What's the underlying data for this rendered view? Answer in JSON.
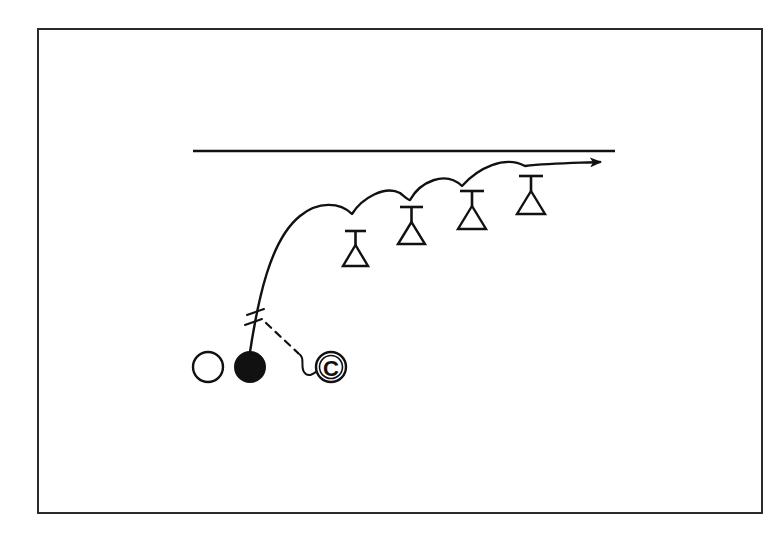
{
  "diagram": {
    "type": "sports drill diagram",
    "colors": {
      "ink": "#111111",
      "background": "#ffffff",
      "frame": "#2a2a2a"
    },
    "frame": {
      "x": 38,
      "y": 29,
      "width": 724,
      "height": 484
    },
    "boundary_line": {
      "x1": 193,
      "y1": 151,
      "x2": 615,
      "y2": 151
    },
    "players": [
      {
        "id": "open-player",
        "shape": "open-circle",
        "cx": 208,
        "cy": 367,
        "r": 15
      },
      {
        "id": "ball-carrier",
        "shape": "filled-circle",
        "cx": 250,
        "cy": 367,
        "r": 15
      },
      {
        "id": "coach",
        "shape": "circled-letter",
        "cx": 331,
        "cy": 367,
        "r": 15,
        "label": "C"
      }
    ],
    "cones": [
      {
        "id": "cone-1",
        "x": 355,
        "top": 231,
        "bottom": 267
      },
      {
        "id": "cone-2",
        "x": 411,
        "top": 207,
        "bottom": 243
      },
      {
        "id": "cone-3",
        "x": 472,
        "top": 190,
        "bottom": 229
      },
      {
        "id": "cone-4",
        "x": 531,
        "top": 176,
        "bottom": 214
      }
    ],
    "route": {
      "description": "Run path from ball carrier weaving over four cones, ending in arrow toward right",
      "end_arrow": {
        "x": 600,
        "y": 162
      }
    },
    "pass_line": {
      "description": "Dashed line with squiggle from coach to the route, marked by double hash",
      "style": "dashed"
    }
  }
}
